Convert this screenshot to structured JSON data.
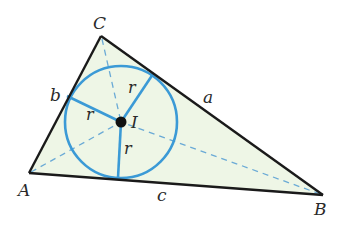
{
  "diagram": {
    "type": "triangle-incircle",
    "colors": {
      "triangle_fill": "#eef6e6",
      "triangle_stroke": "#1a1a1a",
      "circle_stroke": "#3b9ad6",
      "bisector_stroke": "#6aaad6",
      "incenter_fill": "#111111"
    },
    "vertices": {
      "A": {
        "label": "A",
        "x": 29,
        "y": 173
      },
      "B": {
        "label": "B",
        "x": 323,
        "y": 195
      },
      "C": {
        "label": "C",
        "x": 101,
        "y": 36
      }
    },
    "sides": {
      "a": {
        "label": "a"
      },
      "b": {
        "label": "b"
      },
      "c": {
        "label": "c"
      }
    },
    "incenter": {
      "label": "I",
      "x": 121,
      "y": 122
    },
    "inradius": {
      "label": "r",
      "value_px": 56
    },
    "tangent_points": {
      "on_a": {
        "x": 153,
        "y": 74
      },
      "on_b": {
        "x": 67,
        "y": 96
      },
      "on_c": {
        "x": 118,
        "y": 178
      }
    },
    "radius_labels": [
      "r",
      "r",
      "r"
    ]
  }
}
